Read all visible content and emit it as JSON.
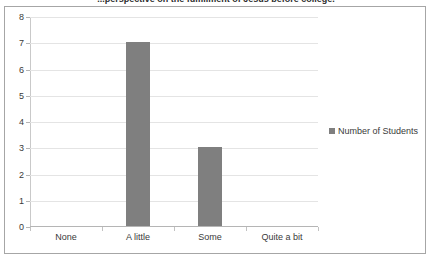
{
  "chart": {
    "title": "...perspective on the fulfillment of Jesus before college.",
    "legend_label": "Number of Students",
    "legend_marker": "square-marker-icon",
    "bar_color": "#7f7f7f",
    "gridline_color": "#e4e4e4",
    "border_color": "#a6a6a6",
    "axis_color": "#b5b5b5"
  },
  "chart_data": {
    "type": "bar",
    "title": "...perspective on the fulfillment of Jesus before college.",
    "categories": [
      "None",
      "A little",
      "Some",
      "Quite a bit"
    ],
    "series": [
      {
        "name": "Number of Students",
        "values": [
          0,
          7,
          3,
          0
        ]
      }
    ],
    "xlabel": "",
    "ylabel": "",
    "ylim": [
      0,
      8
    ],
    "yticks": [
      0,
      1,
      2,
      3,
      4,
      5,
      6,
      7,
      8
    ],
    "ytick_labels": [
      "0",
      "1",
      "2",
      "3",
      "4",
      "5",
      "6",
      "7",
      "8"
    ],
    "grid": true,
    "legend_position": "right"
  }
}
